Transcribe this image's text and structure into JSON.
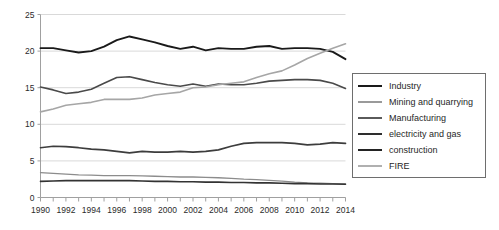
{
  "chart_data": {
    "type": "line",
    "title": "",
    "subtitle": "",
    "xlabel": "",
    "ylabel": "",
    "x": [
      1990,
      1991,
      1992,
      1993,
      1994,
      1995,
      1996,
      1997,
      1998,
      1999,
      2000,
      2001,
      2002,
      2003,
      2004,
      2005,
      2006,
      2007,
      2008,
      2009,
      2010,
      2011,
      2012,
      2013,
      2014
    ],
    "xlim": [
      1990,
      2014
    ],
    "ylim": [
      0,
      25
    ],
    "yticks": [
      0,
      5,
      10,
      15,
      20,
      25
    ],
    "xticks": [
      1990,
      1991,
      1992,
      1993,
      1994,
      1995,
      1996,
      1997,
      1998,
      1999,
      2000,
      2001,
      2002,
      2003,
      2004,
      2005,
      2006,
      2007,
      2008,
      2009,
      2010,
      2011,
      2012,
      2013,
      2014
    ],
    "xtick_labels": [
      "1990",
      "",
      "1992",
      "",
      "1994",
      "",
      "1996",
      "",
      "1998",
      "",
      "2000",
      "",
      "2002",
      "",
      "2004",
      "",
      "2006",
      "",
      "2008",
      "",
      "2010",
      "",
      "2012",
      "",
      "2014"
    ],
    "grid": "horizontal",
    "legend_position": "right-outside",
    "series": [
      {
        "name": "Industry",
        "color": "#1a1a1a",
        "width": 1.9,
        "values": [
          20.4,
          20.4,
          20.1,
          19.8,
          20.0,
          20.6,
          21.5,
          22.0,
          21.6,
          21.2,
          20.7,
          20.3,
          20.6,
          20.1,
          20.4,
          20.3,
          20.3,
          20.6,
          20.7,
          20.3,
          20.4,
          20.4,
          20.3,
          19.9,
          18.9
        ]
      },
      {
        "name": "Mining and quarrying",
        "color": "#8c8c8c",
        "width": 1.3,
        "values": [
          3.4,
          3.3,
          3.2,
          3.1,
          3.05,
          3.0,
          3.0,
          3.0,
          2.95,
          2.9,
          2.85,
          2.8,
          2.8,
          2.75,
          2.7,
          2.6,
          2.5,
          2.45,
          2.35,
          2.25,
          2.1,
          2.0,
          1.95,
          1.9,
          1.85
        ]
      },
      {
        "name": "Manufacturing",
        "color": "#4a4a4a",
        "width": 1.6,
        "values": [
          15.1,
          14.7,
          14.2,
          14.4,
          14.8,
          15.6,
          16.4,
          16.5,
          16.1,
          15.7,
          15.4,
          15.2,
          15.5,
          15.2,
          15.5,
          15.4,
          15.4,
          15.6,
          15.9,
          16.0,
          16.1,
          16.1,
          16.0,
          15.6,
          14.9
        ]
      },
      {
        "name": "electricity and gas",
        "color": "#333333",
        "width": 1.6,
        "values": [
          2.2,
          2.25,
          2.3,
          2.3,
          2.3,
          2.3,
          2.3,
          2.3,
          2.25,
          2.2,
          2.2,
          2.15,
          2.15,
          2.1,
          2.1,
          2.05,
          2.05,
          2.0,
          2.0,
          1.95,
          1.9,
          1.9,
          1.85,
          1.85,
          1.8
        ]
      },
      {
        "name": "construction",
        "color": "#3d3d3d",
        "width": 1.7,
        "values": [
          6.8,
          7.0,
          6.95,
          6.8,
          6.6,
          6.5,
          6.3,
          6.1,
          6.3,
          6.2,
          6.2,
          6.3,
          6.2,
          6.3,
          6.5,
          7.0,
          7.4,
          7.5,
          7.5,
          7.5,
          7.4,
          7.2,
          7.3,
          7.5,
          7.4
        ]
      },
      {
        "name": "FIRE",
        "color": "#a6a6a6",
        "width": 1.6,
        "values": [
          11.7,
          12.1,
          12.6,
          12.8,
          13.0,
          13.4,
          13.4,
          13.4,
          13.6,
          14.0,
          14.2,
          14.4,
          15.0,
          15.1,
          15.4,
          15.6,
          15.8,
          16.4,
          16.9,
          17.3,
          18.1,
          19.0,
          19.7,
          20.4,
          21.0
        ]
      }
    ]
  },
  "axes": {
    "ytick_labels": [
      "0",
      "5",
      "10",
      "15",
      "20",
      "25"
    ],
    "xtick_labels_visible": [
      "1990",
      "1992",
      "1994",
      "1996",
      "1998",
      "2000",
      "2002",
      "2004",
      "2006",
      "2008",
      "2010",
      "2012",
      "2014"
    ]
  },
  "legend": {
    "entries": [
      {
        "label": "Industry",
        "color": "#1a1a1a",
        "thickness": "2.2px"
      },
      {
        "label": "Mining and quarrying",
        "color": "#9a9a9a",
        "thickness": "2px"
      },
      {
        "label": "Manufacturing",
        "color": "#5a5a5a",
        "thickness": "2.2px"
      },
      {
        "label": "electricity and gas",
        "color": "#2e2e2e",
        "thickness": "2.4px"
      },
      {
        "label": "construction",
        "color": "#232323",
        "thickness": "2.4px"
      },
      {
        "label": "FIRE",
        "color": "#b0b0b0",
        "thickness": "2px"
      }
    ]
  },
  "colors": {
    "grid": "#d9d9d9",
    "axis": "#a0a0a0",
    "text": "#2b2b2b",
    "legend_border": "#6e6e6e",
    "background": "#ffffff"
  }
}
